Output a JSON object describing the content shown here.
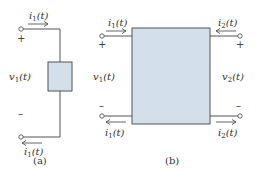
{
  "figure_a": {
    "caption": "(a)",
    "current_top": {
      "sym": "i",
      "sub": "1",
      "arg": "(t)"
    },
    "current_bottom": {
      "sym": "i",
      "sub": "1",
      "arg": "(t)"
    },
    "voltage": {
      "sym": "v",
      "sub": "1",
      "arg": "(t)"
    },
    "plus": "+",
    "minus": "–"
  },
  "figure_b": {
    "caption": "(b)",
    "current_in_left_top": {
      "sym": "i",
      "sub": "1",
      "arg": "(t)"
    },
    "current_in_right_top": {
      "sym": "i",
      "sub": "2",
      "arg": "(t)"
    },
    "current_out_left_bottom": {
      "sym": "i",
      "sub": "1",
      "arg": "(t)"
    },
    "current_out_right_bottom": {
      "sym": "i",
      "sub": "2",
      "arg": "(t)"
    },
    "voltage_left": {
      "sym": "v",
      "sub": "1",
      "arg": "(t)"
    },
    "voltage_right": {
      "sym": "v",
      "sub": "2",
      "arg": "(t)"
    },
    "plus": "+",
    "minus": "–"
  },
  "colors": {
    "box_fill": "#d3dfea",
    "wire": "#555555",
    "background": "#ffffff"
  }
}
